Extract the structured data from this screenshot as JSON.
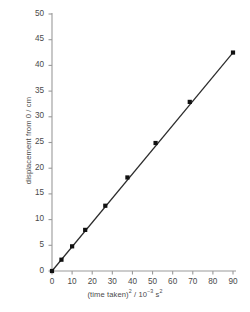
{
  "chart_data": {
    "type": "scatter",
    "title": "",
    "xlabel": "(time taken)2 / 10-3 s2",
    "xlabel_parts": {
      "base1": "(time taken)",
      "sup1": "2",
      "mid": " / 10",
      "sup2": "−3",
      "base2": " s",
      "sup3": "2"
    },
    "ylabel": "displacement from 0 / cm",
    "xlim": [
      0,
      90
    ],
    "ylim": [
      0,
      50
    ],
    "xticks": [
      0,
      10,
      20,
      30,
      40,
      50,
      60,
      70,
      80,
      90
    ],
    "yticks": [
      0,
      5,
      10,
      15,
      20,
      25,
      30,
      35,
      40,
      45,
      50
    ],
    "grid": false,
    "legend": null,
    "marker": "square",
    "marker_color": "#111111",
    "line_color": "#2b2b2b",
    "axis_color": "#9a9a9a",
    "series": [
      {
        "name": "displacement vs (time taken) squared",
        "x": [
          0,
          4.7,
          10.0,
          16.5,
          26.5,
          37.5,
          51.5,
          68.5,
          90.0
        ],
        "y": [
          0,
          2.2,
          4.8,
          8.0,
          12.7,
          18.2,
          24.9,
          32.9,
          42.5
        ]
      }
    ],
    "fit_line": {
      "x": [
        0,
        90
      ],
      "y": [
        0,
        42.5
      ],
      "slope": 0.472,
      "intercept": 0
    }
  },
  "axes_geometry": {
    "plot_left": 52,
    "plot_right": 233,
    "plot_top": 14,
    "plot_bottom": 271
  }
}
